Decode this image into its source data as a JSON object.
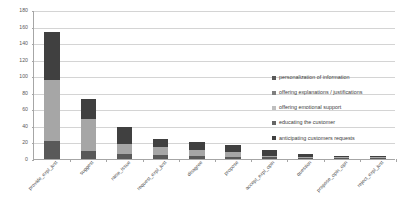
{
  "chart_data": {
    "type": "bar",
    "subtype": "stacked-bar",
    "title": "",
    "xlabel": "",
    "ylabel": "",
    "ylim": [
      0,
      180
    ],
    "yticks": [
      0,
      20,
      40,
      60,
      80,
      100,
      120,
      140,
      160,
      180
    ],
    "ytick_labels": [
      "0",
      "20",
      "40",
      "60",
      "80",
      "100",
      "120",
      "140",
      "160",
      "180"
    ],
    "grid": true,
    "legend_position": "right",
    "categories": [
      "provide_expl_just",
      "suggest",
      "raise_issue",
      "request_expl_just",
      "disagree",
      "propose",
      "accept_expl_opin",
      "question",
      "propose_opin_opn",
      "reject_expl_just"
    ],
    "series": [
      {
        "name": "personalization of information",
        "color": "#595959",
        "values": [
          22,
          10,
          6,
          5,
          4,
          3,
          2,
          1,
          1,
          1
        ]
      },
      {
        "name": "offering explanations / justifications",
        "color": "#a6a6a6",
        "values": [
          73,
          38,
          12,
          9,
          7,
          6,
          2,
          2,
          1,
          1
        ]
      },
      {
        "name": "offering emotional support",
        "color": "#d9d9d9",
        "values": [
          0,
          0,
          0,
          0,
          0,
          0,
          0,
          0,
          0,
          0
        ]
      },
      {
        "name": "educating the customer",
        "color": "#737373",
        "values": [
          0,
          0,
          0,
          0,
          0,
          0,
          0,
          0,
          0,
          0
        ]
      },
      {
        "name": "anticipating customers requests",
        "color": "#404040",
        "values": [
          58,
          24,
          21,
          10,
          10,
          8,
          7,
          3,
          2,
          2
        ]
      }
    ],
    "totals": [
      153,
      72,
      39,
      24,
      21,
      17,
      11,
      6,
      4,
      4
    ]
  },
  "legend": {
    "items": [
      {
        "label": "personalization of information",
        "color": "#595959"
      },
      {
        "label": "offering explanations / justifications",
        "color": "#7f7f7f"
      },
      {
        "label": "offering emotional support",
        "color": "#bfbfbf"
      },
      {
        "label": "educating the customer",
        "color": "#666666"
      },
      {
        "label": "anticipating customers requests",
        "color": "#404040"
      }
    ]
  },
  "axis": {
    "grid_color": "#d4d4d4",
    "axis_color": "#a6a6a6"
  }
}
